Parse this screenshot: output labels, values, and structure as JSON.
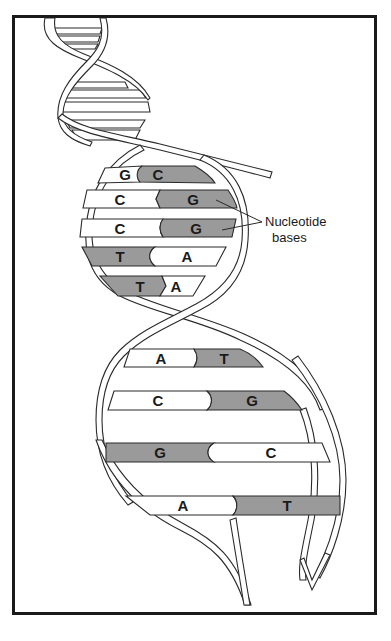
{
  "diagram": {
    "colors": {
      "frame": "#1a1a1a",
      "dark_base": "#9a9a9a",
      "light_base": "#ffffff",
      "outline": "#2a2a2a"
    },
    "callout": {
      "line1": "Nucleotide",
      "line2": "bases"
    },
    "base_pairs": [
      {
        "left": "G",
        "right": "C"
      },
      {
        "left": "C",
        "right": "G"
      },
      {
        "left": "C",
        "right": "G"
      },
      {
        "left": "T",
        "right": "A"
      },
      {
        "left": "T",
        "right": "A"
      },
      {
        "left": "A",
        "right": "T"
      },
      {
        "left": "C",
        "right": "G"
      },
      {
        "left": "G",
        "right": "C"
      },
      {
        "left": "A",
        "right": "T"
      }
    ]
  }
}
